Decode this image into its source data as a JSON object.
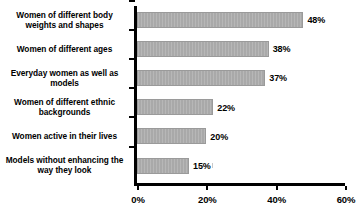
{
  "chart_data": {
    "type": "bar",
    "orientation": "horizontal",
    "title": "",
    "xlabel": "",
    "ylabel": "",
    "xlim": [
      0,
      60
    ],
    "xticks": [
      0,
      20,
      40,
      60
    ],
    "xtick_labels": [
      "0%",
      "20%",
      "40%",
      "60%"
    ],
    "grid": false,
    "legend": false,
    "bar_color": "#a9a9a9",
    "text_color": "#000000",
    "axis_color": "#000000",
    "categories": [
      "Women of different body weights and shapes",
      "Women of different ages",
      "Everyday women as well as models",
      "Women of different ethnic backgrounds",
      "Women active in their lives",
      "Models without enhancing the way they look"
    ],
    "values": [
      48,
      38,
      37,
      22,
      20,
      15
    ],
    "value_labels": [
      "48%",
      "38%",
      "37%",
      "22%",
      "20%",
      "15%"
    ]
  },
  "title_remnant": "clipped chart title"
}
